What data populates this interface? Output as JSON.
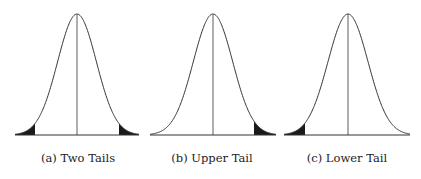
{
  "figure": {
    "panels": [
      {
        "id": "a",
        "caption": "(a) Two Tails",
        "shaded_tails": [
          "lower",
          "upper"
        ],
        "x_start": 15,
        "x_end": 139,
        "mean_x": 77,
        "lower_cut": 35,
        "upper_cut": 119
      },
      {
        "id": "b",
        "caption": "(b) Upper Tail",
        "shaded_tails": [
          "upper"
        ],
        "x_start": 150,
        "x_end": 276,
        "mean_x": 213,
        "lower_cut": null,
        "upper_cut": 254
      },
      {
        "id": "c",
        "caption": "(c) Lower Tail",
        "shaded_tails": [
          "lower"
        ],
        "x_start": 284,
        "x_end": 410,
        "mean_x": 348,
        "lower_cut": 305,
        "upper_cut": null
      }
    ],
    "baseline_y": 135,
    "peak_y": 14,
    "colors": {
      "curve": "#333333",
      "fill": "#1a1a1a",
      "background": "#ffffff"
    }
  }
}
